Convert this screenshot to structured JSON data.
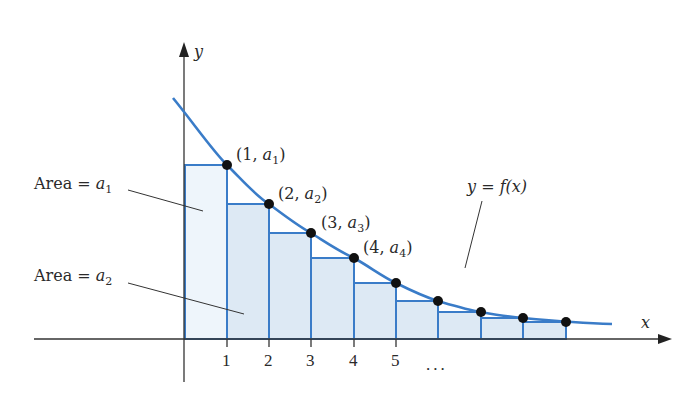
{
  "figure": {
    "axes": {
      "x_label": "x",
      "y_label": "y",
      "x_ticks": [
        "1",
        "2",
        "3",
        "4",
        "5"
      ],
      "x_ellipsis": "..."
    },
    "curve_label": {
      "y": "y",
      "eq": " = ",
      "f": "f",
      "arg": "(x)"
    },
    "points": [
      {
        "open": "(1, ",
        "a": "a",
        "sub": "1",
        "close": ")"
      },
      {
        "open": "(2, ",
        "a": "a",
        "sub": "2",
        "close": ")"
      },
      {
        "open": "(3, ",
        "a": "a",
        "sub": "3",
        "close": ")"
      },
      {
        "open": "(4, ",
        "a": "a",
        "sub": "4",
        "close": ")"
      }
    ],
    "area_labels": [
      {
        "text": "Area = ",
        "a": "a",
        "sub": "1"
      },
      {
        "text": "Area = ",
        "a": "a",
        "sub": "2"
      }
    ],
    "colors": {
      "curve": "#3a7cc8",
      "rect_stroke": "#3a7cc8",
      "rect_fill_first": "#eef5fb",
      "rect_fill": "#dde9f4",
      "axis": "#333333",
      "dot": "#111111"
    }
  }
}
